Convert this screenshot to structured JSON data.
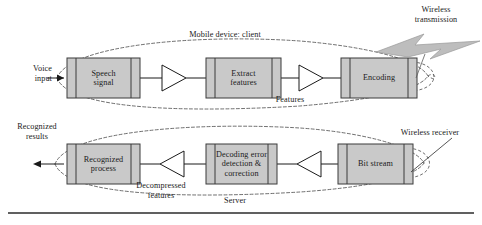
{
  "figure": {
    "colors": {
      "box_fill": "#c9c9c9",
      "box_stroke": "#3b3b3b",
      "bolt_fill": "#bdbdbd",
      "bolt_stroke": "#8a8a8a",
      "dashed_stroke": "#4a4a4a",
      "text": "#1a1a1a",
      "rule": "#2b2b2b",
      "triangle_fill": "#ffffff"
    }
  },
  "client": {
    "group_label": "Mobile device: client",
    "input_label": "Voice\ninput",
    "flow_label": "Features",
    "wireless_label": "Wireless\ntransmission",
    "blocks": [
      {
        "id": "speech-signal",
        "label": "Speech\nsignal"
      },
      {
        "id": "extract-features",
        "label": "Extract\nfeatures"
      },
      {
        "id": "encoding",
        "label": "Encoding"
      }
    ]
  },
  "server": {
    "group_label": "Server",
    "output_label": "Recognized\nresults",
    "flow_label": "Decompressed\nfeatures",
    "wireless_label": "Wireless receiver",
    "blocks": [
      {
        "id": "recognized-process",
        "label": "Recognized\nprocess"
      },
      {
        "id": "decoding-error",
        "label": "Decoding error\ndetection &\ncorrection"
      },
      {
        "id": "bit-stream",
        "label": "Bit stream"
      }
    ]
  }
}
